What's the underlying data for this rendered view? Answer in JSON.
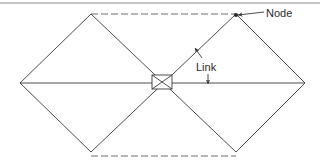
{
  "figure": {
    "type": "node-link-diagram",
    "width": 320,
    "height": 166,
    "background_color": "#ffffff"
  },
  "styles": {
    "line_color": "#3a3a3a",
    "dashed_line_color": "#6e6e6e",
    "rule_color": "#8a8a8a",
    "text_color": "#2b2b2b",
    "solid_stroke_width": 0.9,
    "dashed_stroke_width": 1.0,
    "dash_pattern": "7 3"
  },
  "labels": {
    "node": {
      "text": "Node",
      "x": 266,
      "y": 17
    },
    "link": {
      "text": "Link",
      "x": 196,
      "y": 71
    }
  },
  "nodes": [
    {
      "id": "left",
      "name": "left-vertex",
      "x": 20,
      "y": 83
    },
    {
      "id": "top-left",
      "name": "top-left-vertex",
      "x": 91,
      "y": 14
    },
    {
      "id": "top-right",
      "name": "top-right-vertex",
      "x": 236,
      "y": 14
    },
    {
      "id": "right",
      "name": "right-vertex",
      "x": 305,
      "y": 83
    },
    {
      "id": "bottom-right",
      "name": "bottom-right-vertex",
      "x": 236,
      "y": 152
    },
    {
      "id": "bottom-left",
      "name": "bottom-left-vertex",
      "x": 91,
      "y": 152
    },
    {
      "id": "center",
      "name": "center-switch",
      "x": 162,
      "y": 83
    }
  ],
  "center_box": {
    "x": 152,
    "y": 75,
    "width": 20,
    "height": 14
  },
  "solid_links": [
    {
      "name": "link-left-to-topleft",
      "x1": 20,
      "y1": 83,
      "x2": 91,
      "y2": 14
    },
    {
      "name": "link-left-to-bottomleft",
      "x1": 20,
      "y1": 83,
      "x2": 91,
      "y2": 152
    },
    {
      "name": "link-right-to-topright",
      "x1": 305,
      "y1": 83,
      "x2": 236,
      "y2": 14
    },
    {
      "name": "link-right-to-bottomright",
      "x1": 305,
      "y1": 83,
      "x2": 236,
      "y2": 152
    },
    {
      "name": "link-topleft-to-center",
      "x1": 91,
      "y1": 14,
      "x2": 236,
      "y2": 152
    },
    {
      "name": "link-bottomleft-to-center",
      "x1": 91,
      "y1": 152,
      "x2": 236,
      "y2": 14
    },
    {
      "name": "link-horizontal-spine",
      "x1": 20,
      "y1": 83,
      "x2": 305,
      "y2": 83
    }
  ],
  "dashed_links": [
    {
      "name": "dashed-top-edge",
      "x1": 91,
      "y1": 14,
      "x2": 236,
      "y2": 14
    },
    {
      "name": "dashed-bottom-edge",
      "x1": 91,
      "y1": 156,
      "x2": 236,
      "y2": 156
    }
  ],
  "leaders": {
    "node_leader": {
      "name": "node-leader-line",
      "x1": 264,
      "y1": 12,
      "x2": 238,
      "y2": 15,
      "arrow_at": "start_of_node"
    },
    "link_leader_diagonal": {
      "name": "link-leader-diagonal",
      "x1": 202,
      "y1": 58,
      "x2": 195,
      "y2": 48,
      "arrow_at": "diagonal_link"
    },
    "link_leader_horizontal": {
      "name": "link-leader-horizontal",
      "x1": 208,
      "y1": 74,
      "x2": 208,
      "y2": 84,
      "arrow_at": "horizontal_link"
    }
  },
  "top_rule": {
    "name": "top-horizontal-rule",
    "x1": 0,
    "y1": 3,
    "x2": 320,
    "y2": 3
  }
}
